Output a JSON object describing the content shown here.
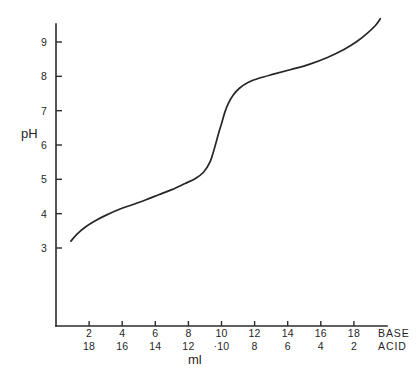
{
  "chart_data": {
    "type": "line",
    "title": "",
    "subtitle": "",
    "xlabel": "ml",
    "ylabel": "pH",
    "grid": false,
    "legend": "none",
    "xlim": [
      0,
      20
    ],
    "ylim": [
      2,
      9.8
    ],
    "y_ticks": [
      3,
      4,
      5,
      6,
      7,
      8,
      9
    ],
    "y_tick_labels": [
      "3",
      "4",
      "5",
      "6",
      "7",
      "8",
      "9"
    ],
    "x_ticks": [
      2,
      4,
      6,
      8,
      10,
      12,
      14,
      16,
      18
    ],
    "x_tick_labels_base": [
      "2",
      "4",
      "6",
      "8",
      "10",
      "12",
      "14",
      "16",
      "18"
    ],
    "x_tick_labels_acid": [
      "18",
      "16",
      "14",
      "12",
      "·10",
      "8",
      "6",
      "4",
      "2"
    ],
    "base_row_label": "BASE",
    "acid_row_label": "ACID",
    "series": [
      {
        "name": "titration-curve",
        "color": "#262626",
        "x": [
          0.9,
          1.3,
          1.8,
          2.4,
          3.0,
          3.8,
          4.6,
          5.4,
          6.2,
          7.0,
          7.8,
          8.4,
          8.9,
          9.3,
          9.6,
          9.8,
          10.0,
          10.2,
          10.4,
          10.7,
          11.1,
          11.6,
          12.3,
          13.2,
          14.2,
          15.3,
          16.4,
          17.4,
          18.2,
          18.8,
          19.3,
          19.6
        ],
        "y": [
          3.2,
          3.42,
          3.62,
          3.8,
          3.95,
          4.12,
          4.26,
          4.4,
          4.55,
          4.7,
          4.88,
          5.02,
          5.2,
          5.5,
          5.95,
          6.3,
          6.62,
          6.95,
          7.2,
          7.45,
          7.66,
          7.82,
          7.95,
          8.07,
          8.2,
          8.35,
          8.55,
          8.78,
          9.02,
          9.25,
          9.48,
          9.68
        ]
      }
    ]
  },
  "axis": {
    "y_label": "pH",
    "x_label": "ml"
  }
}
